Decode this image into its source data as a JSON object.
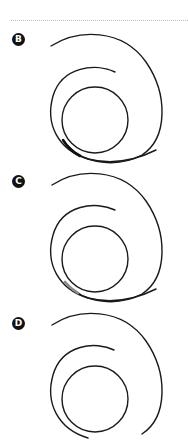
{
  "figure": {
    "divider": "dotted",
    "panels": [
      {
        "label": "B",
        "top": 0,
        "highlight_color": "#111111"
      },
      {
        "label": "C",
        "top": 139,
        "highlight_color": "#8a8a8a"
      },
      {
        "label": "D",
        "top": 277,
        "highlight_color": null
      }
    ]
  },
  "colors": {
    "line": "#1a1a1a",
    "badge_bg": "#111111",
    "badge_text": "#ffffff",
    "divider": "#bdbdbd"
  }
}
